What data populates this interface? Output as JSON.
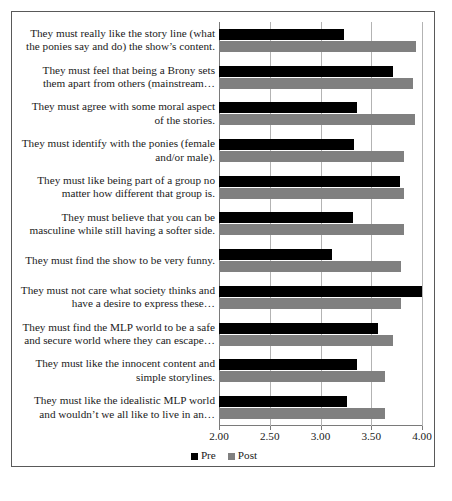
{
  "chart_data": {
    "type": "bar",
    "orientation": "horizontal",
    "title": "",
    "xlabel": "",
    "ylabel": "",
    "xlim": [
      2.0,
      4.0
    ],
    "xticks": [
      "2.00",
      "2.50",
      "3.00",
      "3.50",
      "4.00"
    ],
    "xtick_values": [
      2.0,
      2.5,
      3.0,
      3.5,
      4.0
    ],
    "grid": true,
    "legend_position": "bottom",
    "colors": {
      "pre": "#000000",
      "post": "#808080",
      "frame": "#595959",
      "gridline": "#b3b3b3"
    },
    "categories": [
      "They must really like the story line (what the ponies say and do) the show’s content.",
      "They must feel that being a Brony sets them apart from others (mainstream…",
      "They must agree with some moral aspect of the stories.",
      "They must identify with the ponies (female and/or male).",
      "They must like being part of a group no matter how different that group is.",
      "They must believe that you can be masculine while still having a softer side.",
      "They must find the show to be very funny.",
      "They must not care what society thinks and have a desire to express these…",
      "They must find the MLP world to be a safe and secure world where they can escape…",
      "They must like the innocent content and simple storylines.",
      "They must like the idealistic MLP world and wouldn’t we all like to live in an…"
    ],
    "series": [
      {
        "name": "Pre",
        "values": [
          3.23,
          3.71,
          3.36,
          3.33,
          3.78,
          3.32,
          3.11,
          4.0,
          3.57,
          3.36,
          3.26
        ]
      },
      {
        "name": "Post",
        "values": [
          3.94,
          3.91,
          3.93,
          3.82,
          3.82,
          3.82,
          3.79,
          3.79,
          3.71,
          3.64,
          3.64
        ]
      }
    ]
  },
  "legend": {
    "items": [
      {
        "label": "Pre",
        "key": "pre"
      },
      {
        "label": "Post",
        "key": "post"
      }
    ]
  }
}
